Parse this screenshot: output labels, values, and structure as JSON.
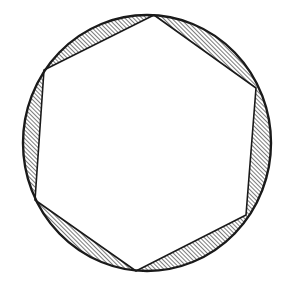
{
  "figure": {
    "colors": {
      "background": "#ffffff",
      "stroke": "#1a1a1a",
      "hatch": "#333333"
    },
    "circle": {
      "cx": 147,
      "cy": 143,
      "rx": 124,
      "ry": 128
    },
    "hexagon_vertices": [
      {
        "x": 154,
        "y": 15
      },
      {
        "x": 256,
        "y": 88
      },
      {
        "x": 246,
        "y": 215
      },
      {
        "x": 136,
        "y": 271
      },
      {
        "x": 35,
        "y": 200
      },
      {
        "x": 44,
        "y": 70
      }
    ],
    "hatched_segments": 6
  }
}
